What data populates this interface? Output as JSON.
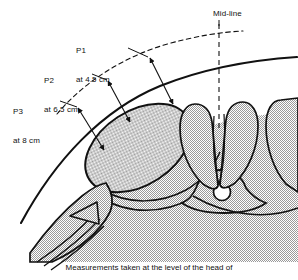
{
  "figure": {
    "caption": "Measurements taken at the level of the head of",
    "background_color": "#ffffff",
    "ink_color": "#111111",
    "tissue_fill_color": "#c8c8c8",
    "lumen_fill_color": "#ffffff"
  },
  "annotations": {
    "midline": {
      "label": "Mid-line",
      "style": "dashed-vertical-line"
    },
    "measurements": [
      {
        "id": "P1",
        "name": "P1",
        "depth_text": "at 4.5 cm",
        "value": 4.5,
        "unit": "cm",
        "line1": "P1",
        "line2": "at 4.5 cm"
      },
      {
        "id": "P2",
        "name": "P2",
        "depth_text": "at 6.5 cm",
        "value": 6.5,
        "unit": "cm",
        "line1": "P2",
        "line2": "at 6.5 cm"
      },
      {
        "id": "P3",
        "name": "P3",
        "depth_text": "at 8 cm",
        "value": 8,
        "unit": "cm",
        "line1": "P3",
        "line2": "at 8 cm"
      }
    ]
  },
  "structures": {
    "skin_surface": "solid-body-outline-arc",
    "outer_reference_arc": "dashed-arc",
    "kidney": "large-tilted-ellipse",
    "vertebral_body": "central-vertebra",
    "spinal_canal": "small-circle",
    "paraspinal_muscles": "paired-muscle-columns",
    "tissue_planes": "layered-strips-lower-left",
    "triangular_muscle": "small-triangle-lower-left"
  }
}
